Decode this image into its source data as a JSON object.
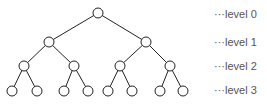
{
  "diagram": {
    "type": "binary-tree",
    "levels": [
      {
        "label": "···level 0",
        "y": 13
      },
      {
        "label": "···level 1",
        "y": 41
      },
      {
        "label": "···level 2",
        "y": 65
      },
      {
        "label": "···level 3",
        "y": 89
      }
    ],
    "nodes": [
      {
        "id": 0,
        "x": 98,
        "y": 13
      },
      {
        "id": 1,
        "x": 49,
        "y": 42
      },
      {
        "id": 2,
        "x": 146,
        "y": 42
      },
      {
        "id": 3,
        "x": 24,
        "y": 66
      },
      {
        "id": 4,
        "x": 74,
        "y": 66
      },
      {
        "id": 5,
        "x": 120,
        "y": 66
      },
      {
        "id": 6,
        "x": 170,
        "y": 66
      },
      {
        "id": 7,
        "x": 12,
        "y": 91
      },
      {
        "id": 8,
        "x": 37,
        "y": 91
      },
      {
        "id": 9,
        "x": 64,
        "y": 91
      },
      {
        "id": 10,
        "x": 88,
        "y": 91
      },
      {
        "id": 11,
        "x": 108,
        "y": 91
      },
      {
        "id": 12,
        "x": 132,
        "y": 91
      },
      {
        "id": 13,
        "x": 160,
        "y": 91
      },
      {
        "id": 14,
        "x": 183,
        "y": 91
      }
    ],
    "edges": [
      [
        0,
        1
      ],
      [
        0,
        2
      ],
      [
        1,
        3
      ],
      [
        1,
        4
      ],
      [
        2,
        5
      ],
      [
        2,
        6
      ],
      [
        3,
        7
      ],
      [
        3,
        8
      ],
      [
        4,
        9
      ],
      [
        4,
        10
      ],
      [
        5,
        11
      ],
      [
        5,
        12
      ],
      [
        6,
        13
      ],
      [
        6,
        14
      ]
    ],
    "colors": {
      "stroke": "#222222",
      "fill": "#ffffff",
      "label": "#555555"
    }
  }
}
